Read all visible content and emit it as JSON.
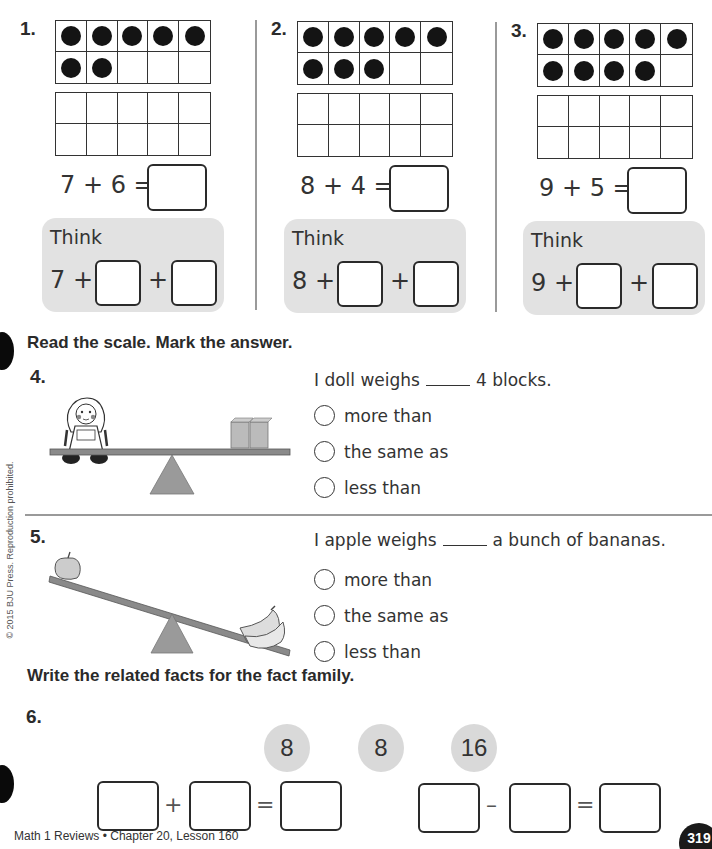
{
  "section1": {
    "problems": [
      {
        "number": "1.",
        "filled_counters": 7,
        "equation": "7 + 6 =",
        "think_label": "Think",
        "think_start": "7 +",
        "think_plus": "+"
      },
      {
        "number": "2.",
        "filled_counters": 8,
        "equation": "8 + 4 =",
        "think_label": "Think",
        "think_start": "8 +",
        "think_plus": "+"
      },
      {
        "number": "3.",
        "filled_counters": 9,
        "equation": "9 + 5 =",
        "think_label": "Think",
        "think_start": "9 +",
        "think_plus": "+"
      }
    ]
  },
  "section2": {
    "instruction": "Read the scale. Mark the answer.",
    "problems": [
      {
        "number": "4.",
        "sentence_start": "I doll weighs",
        "sentence_end": "4 blocks.",
        "image": "doll-and-blocks-scale",
        "options": [
          "more than",
          "the same as",
          "less than"
        ]
      },
      {
        "number": "5.",
        "sentence_start": "I apple weighs",
        "sentence_end": "a bunch of bananas.",
        "image": "apple-and-bananas-scale",
        "options": [
          "more than",
          "the same as",
          "less than"
        ]
      }
    ]
  },
  "section3": {
    "instruction": "Write the related facts for the fact family.",
    "number": "6.",
    "family": [
      "8",
      "8",
      "16"
    ],
    "addition": {
      "op": "+",
      "eq": "="
    },
    "subtraction": {
      "op": "–",
      "eq": "="
    }
  },
  "copyright": "© 2015 BJU Press. Reproduction prohibited.",
  "footer": {
    "text": "Math 1 Reviews • Chapter 20, Lesson 160",
    "page_number": "319"
  },
  "colors": {
    "think_bg": "#e2e2e2",
    "number_circle_bg": "#d9d9d9",
    "counter": "#141414"
  }
}
